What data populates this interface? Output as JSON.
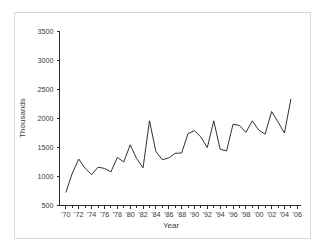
{
  "chart_data": {
    "type": "line",
    "title": "",
    "xlabel": "Year",
    "ylabel": "Thousands",
    "xlim": [
      1969.0,
      2006.5
    ],
    "ylim": [
      500,
      3500
    ],
    "grid": false,
    "legend": "none",
    "y_ticks": [
      500,
      1000,
      1500,
      2000,
      2500,
      3000,
      3500
    ],
    "y_tick_labels": [
      "500",
      "1000",
      "1500",
      "2000",
      "2500",
      "3000",
      "3500"
    ],
    "x_ticks": [
      1970,
      1972,
      1974,
      1976,
      1978,
      1980,
      1982,
      1984,
      1986,
      1988,
      1990,
      1992,
      1994,
      1996,
      1998,
      2000,
      2002,
      2004,
      2006
    ],
    "x_tick_labels": [
      "'70",
      "'72",
      "'74",
      "'76",
      "'78",
      "'80",
      "'82",
      "'84",
      "'86",
      "'88",
      "'90",
      "'92",
      "'94",
      "'96",
      "'98",
      "'00",
      "'02",
      "'04",
      "'06"
    ],
    "x_minor_ticks": [
      1971,
      1973,
      1975,
      1977,
      1979,
      1981,
      1983,
      1985,
      1987,
      1989,
      1991,
      1993,
      1995,
      1997,
      1999,
      2001,
      2003,
      2005
    ],
    "series": [
      {
        "name": "Thousands",
        "color": "#1a1a1a",
        "x": [
          1970,
          1971,
          1972,
          1973,
          1974,
          1975,
          1976,
          1977,
          1978,
          1979,
          1980,
          1981,
          1982,
          1983,
          1984,
          1985,
          1986,
          1987,
          1988,
          1989,
          1990,
          1991,
          1992,
          1993,
          1994,
          1995,
          1996,
          1997,
          1998,
          1999,
          2000,
          2001,
          2002,
          2003,
          2004,
          2005
        ],
        "values": [
          730,
          1060,
          1300,
          1140,
          1030,
          1160,
          1140,
          1080,
          1330,
          1250,
          1545,
          1310,
          1150,
          1960,
          1430,
          1290,
          1320,
          1400,
          1405,
          1740,
          1790,
          1680,
          1500,
          1960,
          1470,
          1440,
          1900,
          1880,
          1760,
          1960,
          1800,
          1730,
          2120,
          1940,
          1750,
          2330
        ]
      }
    ]
  },
  "axes": {
    "y_axis_title": "Thousands",
    "x_axis_title": "Year"
  }
}
